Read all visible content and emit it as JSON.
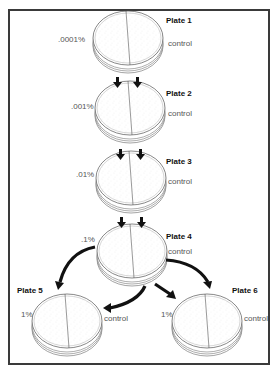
{
  "diagram": {
    "type": "serial-dilution-plates",
    "colors": {
      "frame": "#3a3a3a",
      "plate_stroke": "#555555",
      "arrow": "#111111",
      "text": "#555555",
      "title": "#111111"
    },
    "plates": [
      {
        "id": 1,
        "title": "Plate 1",
        "left_label": ".0001%",
        "right_label": "control"
      },
      {
        "id": 2,
        "title": "Plate 2",
        "left_label": ".001%",
        "right_label": "control"
      },
      {
        "id": 3,
        "title": "Plate 3",
        "left_label": ".01%",
        "right_label": "control"
      },
      {
        "id": 4,
        "title": "Plate 4",
        "left_label": ".1%",
        "right_label": "control"
      },
      {
        "id": 5,
        "title": "Plate 5",
        "left_label": "1%",
        "right_label": "control"
      },
      {
        "id": 6,
        "title": "Plate 6",
        "left_label": "1%",
        "right_label": "control"
      }
    ],
    "arrows": [
      {
        "from": 1,
        "to": 2,
        "style": "double-down"
      },
      {
        "from": 2,
        "to": 3,
        "style": "double-down"
      },
      {
        "from": 3,
        "to": 4,
        "style": "double-down"
      },
      {
        "from": 4,
        "to": 5,
        "style": "curved"
      },
      {
        "from": 4,
        "to": 5,
        "style": "curved",
        "target": "control-side"
      },
      {
        "from": 4,
        "to": 6,
        "style": "curved"
      },
      {
        "from": 4,
        "to": 6,
        "style": "straight"
      }
    ]
  }
}
